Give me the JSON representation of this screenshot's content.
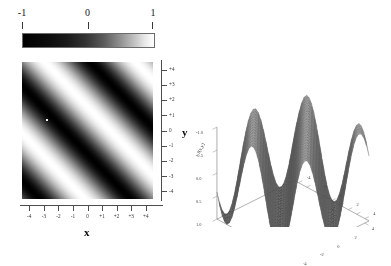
{
  "figure": {
    "title": "",
    "background": "#ffffff",
    "panels": [
      "colorbar",
      "density-plot",
      "surface-plot"
    ]
  },
  "colorbar": {
    "name": "grayscale-colorbar",
    "orientation": "horizontal",
    "tick_labels": [
      "-1",
      "0",
      "1"
    ],
    "tick_values": [
      -1,
      0,
      1
    ],
    "low_color": "#000000",
    "high_color": "#ffffff",
    "colormap": "GrayLevel"
  },
  "density": {
    "xlabel": "x",
    "ylabel": "y",
    "x_ticks": [
      "-4",
      "-3",
      "-2",
      "-1",
      "0",
      "+1",
      "+2",
      "+3",
      "+4"
    ],
    "y_ticks": [
      "+4",
      "+3",
      "+2",
      "+1",
      "0",
      "-1",
      "-2",
      "-3",
      "-4"
    ],
    "x_tick_values": [
      -4,
      -3,
      -2,
      -1,
      0,
      1,
      2,
      3,
      4
    ],
    "y_tick_values": [
      4,
      3,
      2,
      1,
      0,
      -1,
      -2,
      -3,
      -4
    ]
  },
  "surface": {
    "z_ticks": [
      "1.0",
      "0.5",
      "0.0",
      "-0.5",
      "-1.0"
    ],
    "z_tick_values": [
      1.0,
      0.5,
      0.0,
      -0.5,
      -1.0
    ],
    "zlabel": "f(x,y)",
    "x_ticks": [
      "-4",
      "-2",
      "0",
      "2",
      "4"
    ],
    "y_ticks": [
      "-4",
      "-2",
      "0",
      "2",
      "4"
    ]
  },
  "chart_data": [
    {
      "type": "heatmap",
      "title": "",
      "xlabel": "x",
      "ylabel": "y",
      "xlim": [
        -4.5,
        4.5
      ],
      "ylim": [
        -4.5,
        4.5
      ],
      "zlim": [
        -1,
        1
      ],
      "colormap": "grayscale",
      "colorbar_ticks": [
        -1,
        0,
        1
      ],
      "grid": false,
      "function": "sin(x + y)",
      "description": "Diagonal sinusoidal bands running lower-left to upper-right, about four full periods across the domain; black = -1, white = +1",
      "x": [
        -4.5,
        -3.5,
        -2.5,
        -1.5,
        -0.5,
        0.5,
        1.5,
        2.5,
        3.5,
        4.5
      ],
      "y": [
        4.5,
        3.5,
        2.5,
        1.5,
        0.5,
        -0.5,
        -1.5,
        -2.5,
        -3.5,
        -4.5
      ],
      "values": [
        [
          1.0,
          0.42,
          -0.46,
          -1.0,
          -0.49,
          0.41,
          1.0,
          0.53,
          -0.35,
          -0.99
        ],
        [
          0.42,
          -0.46,
          -1.0,
          -0.49,
          0.41,
          1.0,
          0.53,
          -0.35,
          -0.99,
          -0.58
        ],
        [
          -0.46,
          -1.0,
          -0.49,
          0.41,
          1.0,
          0.53,
          -0.35,
          -0.99,
          -0.58,
          0.28
        ],
        [
          -1.0,
          -0.49,
          0.41,
          1.0,
          0.53,
          -0.35,
          -0.99,
          -0.58,
          0.28,
          0.96
        ],
        [
          -0.49,
          0.41,
          1.0,
          0.53,
          -0.35,
          -0.99,
          -0.58,
          0.28,
          0.96,
          0.63
        ],
        [
          0.41,
          1.0,
          0.53,
          -0.35,
          -0.99,
          -0.58,
          0.28,
          0.96,
          0.63,
          -0.21
        ],
        [
          1.0,
          0.53,
          -0.35,
          -0.99,
          -0.58,
          0.28,
          0.96,
          0.63,
          -0.21,
          -0.94
        ],
        [
          0.53,
          -0.35,
          -0.99,
          -0.58,
          0.28,
          0.96,
          0.63,
          -0.21,
          -0.94,
          -0.68
        ],
        [
          -0.35,
          -0.99,
          -0.58,
          0.28,
          0.96,
          0.63,
          -0.21,
          -0.94,
          -0.68,
          0.13
        ],
        [
          -0.99,
          -0.58,
          0.28,
          0.96,
          0.63,
          -0.21,
          -0.94,
          -0.68,
          0.13,
          0.91
        ]
      ]
    },
    {
      "type": "surface",
      "title": "",
      "xlabel": "",
      "ylabel": "",
      "zlabel": "f(x,y)",
      "xlim": [
        -4.5,
        4.5
      ],
      "ylim": [
        -4.5,
        4.5
      ],
      "zlim": [
        -1.0,
        1.0
      ],
      "z_ticks": [
        -1.0,
        -0.5,
        0.0,
        0.5,
        1.0
      ],
      "grid": true,
      "mesh": "wireframe-shaded",
      "function": "sin(x + y)",
      "description": "3D surface of the same sinusoid showing about five sharp diagonal wave ridges, gray mesh shading",
      "num_ridges": 5,
      "view": "default 3D perspective, elevation approx 25 degrees"
    }
  ]
}
